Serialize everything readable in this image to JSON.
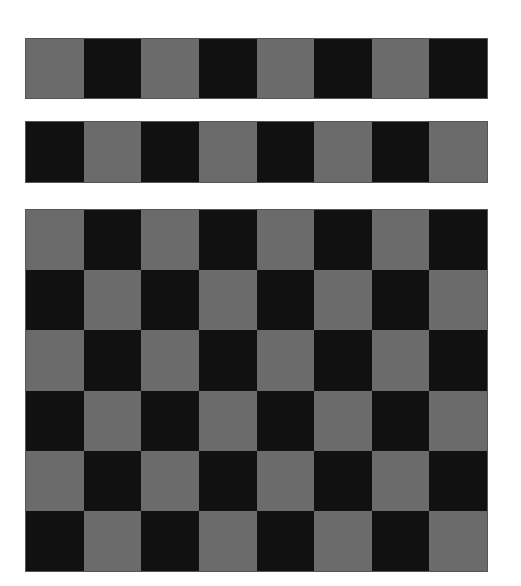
{
  "colors": {
    "light": "#6b6b6b",
    "dark": "#111111",
    "background": "#ffffff"
  },
  "strips": [
    {
      "name": "strip-top",
      "top": 38,
      "height": 61,
      "pattern": [
        "g",
        "b",
        "g",
        "b",
        "g",
        "b",
        "g",
        "b"
      ]
    },
    {
      "name": "strip-second",
      "top": 121,
      "height": 62,
      "pattern": [
        "b",
        "g",
        "b",
        "g",
        "b",
        "g",
        "b",
        "g"
      ]
    }
  ],
  "board": {
    "columns": 8,
    "rows": 6,
    "first_cell": "g"
  }
}
